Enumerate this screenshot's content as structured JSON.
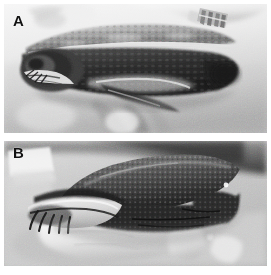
{
  "figure": {
    "type": "photographic-figure",
    "color_mode": "grayscale",
    "background": "#ffffff",
    "panel_count": 2,
    "layout": "two-panel-vertical-stack"
  },
  "panels": [
    {
      "id": "A",
      "label": "A",
      "position": "top",
      "subject": "turtle held horizontally in gloved hands, lateral view of head and carapace",
      "description": "Grayscale photograph of a turtle in lateral view held by a gloved hand; mottled light carapace, dark head and neck, pale plastron edge; gloved fingers and a textured cuff appear at upper right; light cloth drape background.",
      "dominant_tones": [
        "#f2f2f2",
        "#c9c9c9",
        "#8d8d8d",
        "#4c4c4c",
        "#232323"
      ]
    },
    {
      "id": "B",
      "label": "B",
      "position": "bottom",
      "subject": "turtle held in gloved hands, lateral view with head and claws extended",
      "description": "Grayscale photograph of a darker turtle in lateral view; granular dark carapace, pale throat and jaw, dark claws of the forelimb visible at left; white-gloved fingers support the animal from below; a pale paper sheet is at upper left and darker instruments at right.",
      "dominant_tones": [
        "#ededed",
        "#b4b4b4",
        "#787878",
        "#3a3a3a",
        "#161616"
      ]
    }
  ],
  "labels": {
    "panel_a": "A",
    "panel_b": "B"
  }
}
